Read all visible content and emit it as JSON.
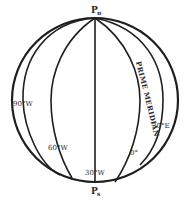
{
  "diagram": {
    "type": "globe-meridians",
    "poles": {
      "north": {
        "label": "P",
        "subscript": "n"
      },
      "south": {
        "label": "P",
        "subscript": "s"
      }
    },
    "meridians": [
      {
        "label": "90°W"
      },
      {
        "label": "60°W"
      },
      {
        "label": "30°W"
      },
      {
        "label": "0°"
      },
      {
        "label": "30°E"
      }
    ],
    "prime_meridian": {
      "label": "PRIME MERIDIAN",
      "accent_color": "#3a8a3a"
    },
    "line_color": "#1e1e1e"
  }
}
